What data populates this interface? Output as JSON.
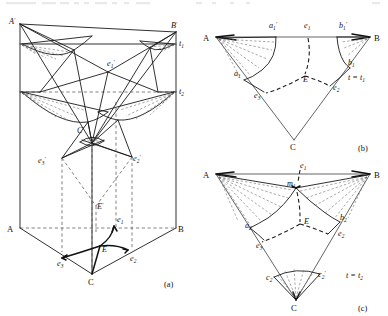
{
  "figure": {
    "panels": [
      {
        "id": "a",
        "caption": "(a)",
        "description": "Triangular prism with curved wavefront surfaces at levels t1 and t2",
        "labels": [
          {
            "name": "A-prime",
            "text": "A",
            "prime": true,
            "sub": "",
            "x": 9,
            "y": 24
          },
          {
            "name": "B-prime",
            "text": "B",
            "prime": true,
            "sub": "",
            "x": 173,
            "y": 31
          },
          {
            "name": "t1",
            "text": "t",
            "prime": false,
            "sub": "1",
            "x": 179,
            "y": 44
          },
          {
            "name": "t2",
            "text": "t",
            "prime": false,
            "sub": "2",
            "x": 179,
            "y": 92
          },
          {
            "name": "e1-prime",
            "text": "e",
            "prime": true,
            "sub": "1",
            "x": 110,
            "y": 63
          },
          {
            "name": "C-prime",
            "text": "C",
            "prime": true,
            "sub": "",
            "x": 80,
            "y": 131
          },
          {
            "name": "e3-prime",
            "text": "e",
            "prime": true,
            "sub": "3",
            "x": 41,
            "y": 160
          },
          {
            "name": "e2-prime",
            "text": "e",
            "prime": true,
            "sub": "2",
            "x": 134,
            "y": 159
          },
          {
            "name": "E-prime",
            "text": "E",
            "prime": true,
            "sub": "",
            "x": 93,
            "y": 205
          },
          {
            "name": "A",
            "text": "A",
            "prime": false,
            "sub": "",
            "x": 9,
            "y": 231
          },
          {
            "name": "B",
            "text": "B",
            "prime": false,
            "sub": "",
            "x": 176,
            "y": 231
          },
          {
            "name": "e1",
            "text": "e",
            "prime": false,
            "sub": "1",
            "x": 117,
            "y": 218
          },
          {
            "name": "E",
            "text": "E",
            "prime": false,
            "sub": "",
            "x": 101,
            "y": 248
          },
          {
            "name": "e3",
            "text": "e",
            "prime": false,
            "sub": "3",
            "x": 62,
            "y": 259
          },
          {
            "name": "e2",
            "text": "e",
            "prime": false,
            "sub": "2",
            "x": 130,
            "y": 256
          },
          {
            "name": "C",
            "text": "C",
            "prime": false,
            "sub": "",
            "x": 92,
            "y": 280
          }
        ]
      },
      {
        "id": "b",
        "caption": "(b)",
        "time_label": {
          "lhs": "t",
          "eq": " = ",
          "rhs": "t",
          "rhs_sub": "1"
        },
        "description": "Cross-section of the wavefront at time t = t1",
        "labels": [
          {
            "name": "A",
            "text": "A",
            "prime": false,
            "sub": "",
            "x": 206,
            "y": 41
          },
          {
            "name": "B",
            "text": "B",
            "prime": false,
            "sub": "",
            "x": 376,
            "y": 41
          },
          {
            "name": "C",
            "text": "C",
            "prime": false,
            "sub": "",
            "x": 291,
            "y": 146
          },
          {
            "name": "a1-prime",
            "text": "a",
            "prime": true,
            "sub": "1",
            "x": 272,
            "y": 25
          },
          {
            "name": "e1",
            "text": "e",
            "prime": false,
            "sub": "1",
            "x": 307,
            "y": 25
          },
          {
            "name": "b1-prime",
            "text": "b",
            "prime": true,
            "sub": "1",
            "x": 343,
            "y": 25
          },
          {
            "name": "a1",
            "text": "a",
            "prime": false,
            "sub": "1",
            "x": 238,
            "y": 72
          },
          {
            "name": "b1",
            "text": "b",
            "prime": false,
            "sub": "1",
            "x": 348,
            "y": 62
          },
          {
            "name": "E",
            "text": "E",
            "prime": false,
            "sub": "",
            "x": 302,
            "y": 79
          },
          {
            "name": "e2",
            "text": "e",
            "prime": false,
            "sub": "2",
            "x": 336,
            "y": 86
          },
          {
            "name": "e3",
            "text": "e",
            "prime": false,
            "sub": "3",
            "x": 258,
            "y": 94
          }
        ]
      },
      {
        "id": "c",
        "caption": "(c)",
        "time_label": {
          "lhs": "t",
          "eq": " = ",
          "rhs": "t",
          "rhs_sub": "2"
        },
        "description": "Cross-section of the wavefront at time t = t2",
        "labels": [
          {
            "name": "A",
            "text": "A",
            "prime": false,
            "sub": "",
            "x": 206,
            "y": 177
          },
          {
            "name": "B",
            "text": "B",
            "prime": false,
            "sub": "",
            "x": 376,
            "y": 177
          },
          {
            "name": "C",
            "text": "C",
            "prime": false,
            "sub": "",
            "x": 293,
            "y": 307
          },
          {
            "name": "e1",
            "text": "e",
            "prime": false,
            "sub": "1",
            "x": 303,
            "y": 166
          },
          {
            "name": "m1",
            "text": "m",
            "prime": false,
            "sub": "1",
            "x": 296,
            "y": 187
          },
          {
            "name": "E",
            "text": "E",
            "prime": false,
            "sub": "",
            "x": 306,
            "y": 220
          },
          {
            "name": "a2",
            "text": "a",
            "prime": false,
            "sub": "2",
            "x": 249,
            "y": 224
          },
          {
            "name": "b2",
            "text": "b",
            "prime": false,
            "sub": "2",
            "x": 340,
            "y": 217
          },
          {
            "name": "e2",
            "text": "e",
            "prime": false,
            "sub": "2",
            "x": 342,
            "y": 231
          },
          {
            "name": "e3",
            "text": "e",
            "prime": false,
            "sub": "3",
            "x": 260,
            "y": 243
          },
          {
            "name": "c2",
            "text": "c",
            "prime": false,
            "sub": "2",
            "x": 272,
            "y": 274
          },
          {
            "name": "c2-prime",
            "text": "c",
            "prime": true,
            "sub": "2",
            "x": 325,
            "y": 271
          }
        ]
      }
    ],
    "colors": {
      "ink": "#1a1a1a",
      "dash": "#5a5a5a",
      "hatch": "#6e6e6e",
      "background": "#ffffff"
    }
  }
}
